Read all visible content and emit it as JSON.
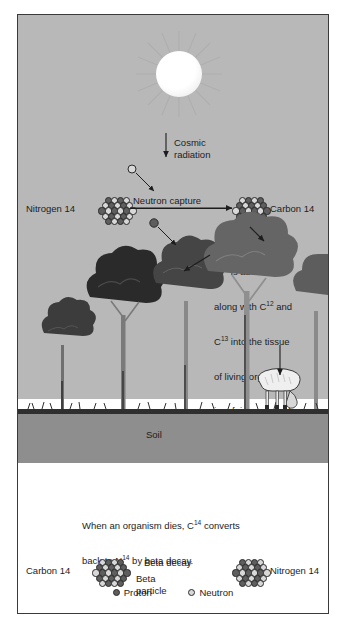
{
  "upper": {
    "cosmic_radiation_label": "Cosmic\nradiation",
    "nitrogen_label": "Nitrogen 14",
    "neutron_capture_label": "Neutron capture",
    "carbon_label": "Carbon 14",
    "absorption_text_lines": [
      "C14 is absorbed",
      "along with C12 and",
      "C13 into the tissue",
      "of living organisms",
      "in a fairly constant",
      "ratio."
    ],
    "absorption_text_parts": {
      "l1_a": "C",
      "l1_sup": "14",
      "l1_b": " is absorbed",
      "l2_a": "along with C",
      "l2_sup": "12",
      "l2_b": " and",
      "l3_a": "C",
      "l3_sup": "13",
      "l3_b": " into the tissue",
      "l4": "of living organisms",
      "l5": "in a fairly constant",
      "l6": "ratio."
    }
  },
  "scene": {
    "soil_label": "Soil"
  },
  "lower": {
    "decay_text_parts": {
      "l1_a": "When an organism dies, C",
      "l1_sup": "14",
      "l1_b": " converts",
      "l2_a": "back to N",
      "l2_sup": "14",
      "l2_b": " by beta decay."
    },
    "carbon_label": "Carbon 14",
    "beta_decay_label": "Beta decay",
    "beta_particle_label": "Beta\nparticle",
    "nitrogen_label": "Nitrogen 14"
  },
  "legend": {
    "proton_label": "Proton",
    "neutron_label": "Neutron"
  },
  "colors": {
    "sky": "#b8b8b8",
    "soil": "#8e8e8e",
    "grass_line": "#2f2f2f",
    "panel_border": "#3a3a3a",
    "text": "#1d1d1d",
    "proton": "#5e5e5e",
    "neutron": "#d8d8d8",
    "sun": "#ffffff"
  }
}
